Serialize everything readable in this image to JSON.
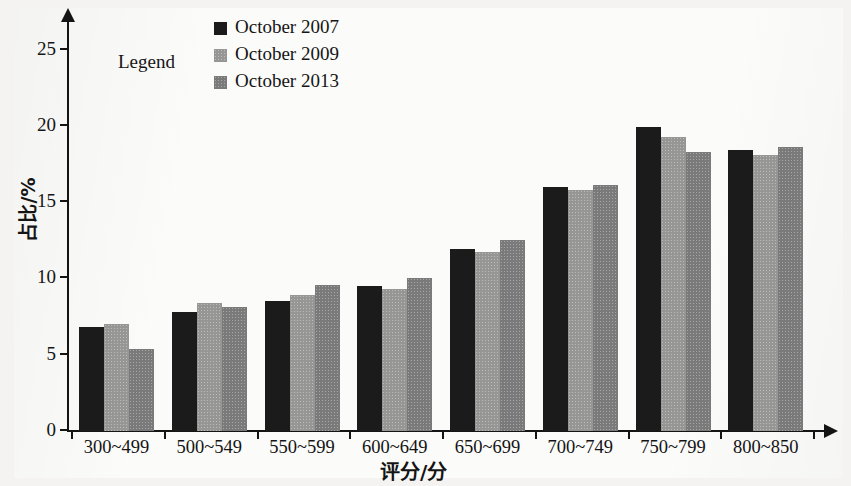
{
  "chart_data": {
    "type": "bar",
    "title": "",
    "xlabel": "评分/分",
    "ylabel": "占比/%",
    "ylim": [
      0,
      27
    ],
    "yticks": [
      0,
      5,
      10,
      15,
      20,
      25
    ],
    "grid": false,
    "legend_position": "top-center",
    "legend_title": "Legend",
    "categories": [
      "300~499",
      "500~549",
      "550~599",
      "600~649",
      "650~699",
      "700~749",
      "750~799",
      "800~850"
    ],
    "series": [
      {
        "name": "October 2007",
        "color": "#1b1b1b",
        "values": [
          6.8,
          7.8,
          8.5,
          9.5,
          11.9,
          16.0,
          19.9,
          18.4
        ]
      },
      {
        "name": "October 2009",
        "color": "#9e9e9c",
        "values": [
          7.0,
          8.4,
          8.9,
          9.3,
          11.7,
          15.8,
          19.3,
          18.1
        ]
      },
      {
        "name": "October 2013",
        "color": "#818181",
        "values": [
          5.4,
          8.1,
          9.6,
          10.0,
          12.5,
          16.1,
          18.3,
          18.6
        ]
      }
    ]
  },
  "axes": {
    "y_title": "占比/%",
    "x_title": "评分/分",
    "y_tick_labels": [
      "0",
      "5",
      "10",
      "15",
      "20",
      "25"
    ]
  },
  "legend": {
    "title": "Legend",
    "entries": [
      {
        "label": "October 2007",
        "color": "#1b1b1b"
      },
      {
        "label": "October 2009",
        "color": "#9e9e9c"
      },
      {
        "label": "October 2013",
        "color": "#818181"
      }
    ]
  }
}
